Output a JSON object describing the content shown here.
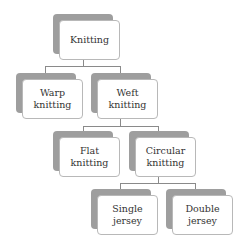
{
  "diagram": {
    "type": "hierarchy",
    "nodes": [
      {
        "id": "knitting",
        "lines": [
          "Knitting",
          ""
        ]
      },
      {
        "id": "warp",
        "lines": [
          "Warp",
          "knitting"
        ]
      },
      {
        "id": "weft",
        "lines": [
          "Weft",
          "knitting"
        ]
      },
      {
        "id": "flat",
        "lines": [
          "Flat",
          "knitting"
        ]
      },
      {
        "id": "circular",
        "lines": [
          "Circular",
          "knitting"
        ]
      },
      {
        "id": "single",
        "lines": [
          "Single",
          "jersey"
        ]
      },
      {
        "id": "double",
        "lines": [
          "Double",
          "jersey"
        ]
      }
    ],
    "edges": [
      [
        "knitting",
        "warp"
      ],
      [
        "knitting",
        "weft"
      ],
      [
        "weft",
        "flat"
      ],
      [
        "weft",
        "circular"
      ],
      [
        "circular",
        "single"
      ],
      [
        "circular",
        "double"
      ]
    ],
    "colors": {
      "shadow": "#9e9e9e",
      "box": "#ffffff",
      "border": "#b8b8b8",
      "line": "#8a8a8a"
    }
  }
}
